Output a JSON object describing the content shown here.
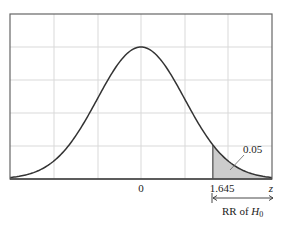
{
  "chart_data": {
    "type": "area",
    "title": "",
    "xlabel": "z",
    "ylabel": "",
    "distribution": "standard normal density",
    "xlim": [
      -3,
      3
    ],
    "ylim": [
      0,
      0.5
    ],
    "grid": true,
    "x_ticks": [
      {
        "value": 0,
        "label": "0"
      },
      {
        "value": 1.645,
        "label": "1.645"
      }
    ],
    "shaded_region": {
      "from": 1.645,
      "to": 3,
      "area": 0.05,
      "label": "0.05"
    },
    "annotations": [
      {
        "text": "0.05",
        "points_to": "shaded right tail"
      },
      {
        "text": "RR of H0",
        "type": "double-arrow",
        "from": 1.645,
        "to": 3
      }
    ],
    "curve_color": "#333333",
    "shade_color": "#cccccc"
  },
  "labels": {
    "tick_zero": "0",
    "tick_critical": "1.645",
    "axis_var": "z",
    "area": "0.05",
    "rr_prefix": "RR of ",
    "rr_h": "H",
    "rr_sub": "0"
  }
}
